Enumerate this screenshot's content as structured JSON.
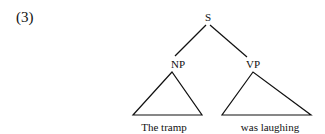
{
  "example": {
    "number": "(3)"
  },
  "tree": {
    "root": {
      "label": "S",
      "x": 208,
      "y": 21
    },
    "children": [
      {
        "label": "NP",
        "x": 178,
        "y": 68,
        "leaf_text": "The tramp",
        "leaf_x": 164
      },
      {
        "label": "VP",
        "x": 253,
        "y": 68,
        "leaf_text": "was laughing",
        "leaf_x": 270
      }
    ]
  }
}
